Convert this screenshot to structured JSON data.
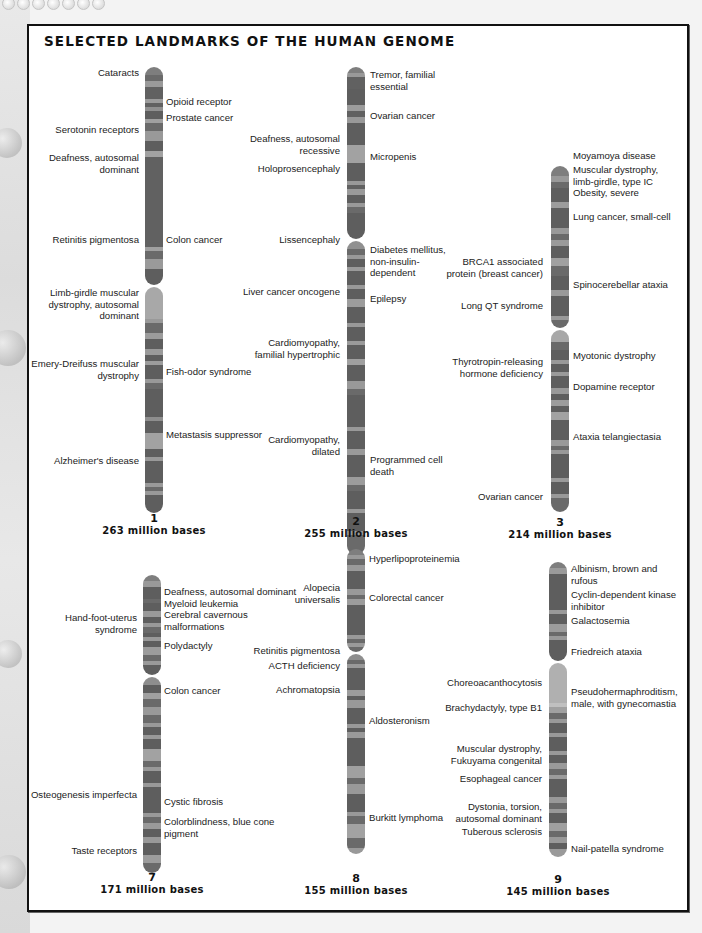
{
  "title": "SELECTED LANDMARKS OF THE HUMAN GENOME",
  "colors": {
    "band_dark": "#5e5e5e",
    "band_mid": "#777777",
    "band_light": "#9a9a9a",
    "band_pale": "#b4b4b4",
    "frame": "#111111",
    "background": "#ffffff"
  },
  "chromosomes": [
    {
      "number": "1",
      "size_label": "263 million bases",
      "left_labels": [
        "Cataracts",
        "Serotonin receptors",
        "Deafness, autosomal\ndominant",
        "Retinitis pigmentosa",
        "Limb-girdle muscular\ndystrophy, autosomal\ndominant",
        "Emery-Dreifuss muscular\ndystrophy",
        "Alzheimer's disease"
      ],
      "right_labels": [
        "Opioid receptor",
        "Prostate cancer",
        "Colon cancer",
        "Fish-odor syndrome",
        "Metastasis suppressor"
      ]
    },
    {
      "number": "2",
      "size_label": "255 million bases",
      "left_labels": [
        "Deafness, autosomal\nrecessive",
        "Holoprosencephaly",
        "Lissencephaly",
        "Liver cancer oncogene",
        "Cardiomyopathy,\nfamilial hypertrophic",
        "Cardiomyopathy,\ndilated"
      ],
      "right_labels": [
        "Tremor, familial\nessential",
        "Ovarian cancer",
        "Micropenis",
        "Diabetes mellitus,\nnon-insulin-\ndependent",
        "Epilepsy",
        "Programmed cell\ndeath"
      ]
    },
    {
      "number": "3",
      "size_label": "214 million bases",
      "left_labels": [
        "BRCA1 associated\nprotein (breast cancer)",
        "Long QT syndrome",
        "Thyrotropin-releasing\nhormone deficiency",
        "Ovarian cancer"
      ],
      "right_labels": [
        "Moyamoya disease",
        "Muscular dystrophy,\nlimb-girdle, type IC",
        "Obesity, severe",
        "Lung cancer, small-cell",
        "Spinocerebellar ataxia",
        "Myotonic dystrophy",
        "Dopamine receptor",
        "Ataxia telangiectasia"
      ]
    },
    {
      "number": "7",
      "size_label": "171 million bases",
      "left_labels": [
        "Hand-foot-uterus\nsyndrome",
        "Osteogenesis imperfecta",
        "Taste receptors"
      ],
      "right_labels": [
        "Deafness, autosomal dominant",
        "Myeloid leukemia",
        "Cerebral cavernous\nmalformations",
        "Polydactyly",
        "Colon cancer",
        "Cystic fibrosis",
        "Colorblindness, blue cone\npigment"
      ]
    },
    {
      "number": "8",
      "size_label": "155 million bases",
      "left_labels": [
        "Alopecia\nuniversalis",
        "Retinitis pigmentosa",
        "ACTH deficiency",
        "Achromatopsia"
      ],
      "right_labels": [
        "Hyperlipoproteinemia",
        "Colorectal cancer",
        "Aldosteronism",
        "Burkitt lymphoma"
      ]
    },
    {
      "number": "9",
      "size_label": "145 million bases",
      "left_labels": [
        "Choreoacanthocytosis",
        "Brachydactyly, type B1",
        "Muscular dystrophy,\nFukuyama congenital",
        "Esophageal cancer",
        "Dystonia, torsion,\nautosomal dominant",
        "Tuberous sclerosis"
      ],
      "right_labels": [
        "Albinism, brown and\nrufous",
        "Cyclin-dependent kinase\ninhibitor",
        "Galactosemia",
        "Friedreich ataxia",
        "Pseudohermaphroditism,\nmale, with gynecomastia",
        "Nail-patella syndrome"
      ]
    }
  ]
}
